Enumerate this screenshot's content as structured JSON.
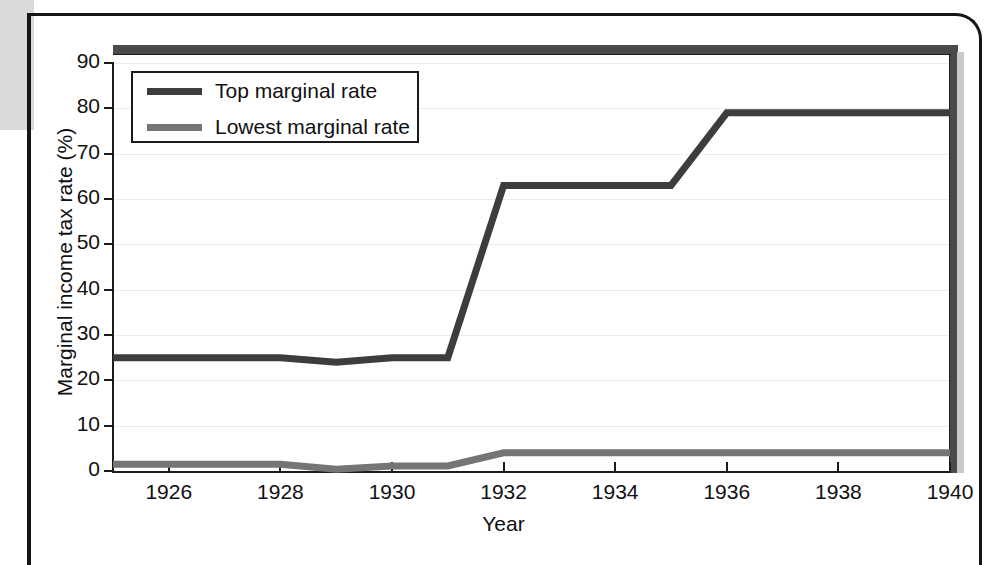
{
  "figure": {
    "x_axis_title": "Year",
    "y_axis_title": "Marginal income tax rate (%)"
  },
  "legend": {
    "items": [
      {
        "label": "Top marginal rate",
        "color": "#3d3d3f",
        "name": "top-marginal-rate"
      },
      {
        "label": "Lowest marginal rate",
        "color": "#757578",
        "name": "lowest-marginal-rate"
      }
    ]
  },
  "axes": {
    "y_ticks": [
      "0",
      "10",
      "20",
      "30",
      "40",
      "50",
      "60",
      "70",
      "80",
      "90"
    ],
    "x_ticks": [
      "1926",
      "1928",
      "1930",
      "1932",
      "1934",
      "1936",
      "1938",
      "1940"
    ]
  },
  "chart_data": {
    "type": "line",
    "title": "",
    "xlabel": "Year",
    "ylabel": "Marginal income tax rate (%)",
    "xlim": [
      1925,
      1940
    ],
    "ylim": [
      0,
      90
    ],
    "xticks": [
      1926,
      1928,
      1930,
      1932,
      1934,
      1936,
      1938,
      1940
    ],
    "yticks": [
      0,
      10,
      20,
      30,
      40,
      50,
      60,
      70,
      80,
      90
    ],
    "grid": "horizontal",
    "legend_position": "upper-left-inside",
    "x": [
      1925,
      1926,
      1927,
      1928,
      1929,
      1930,
      1931,
      1932,
      1933,
      1934,
      1935,
      1936,
      1937,
      1938,
      1939,
      1940
    ],
    "series": [
      {
        "name": "Top marginal rate",
        "color": "#3d3d3f",
        "values": [
          25,
          25,
          25,
          25,
          24,
          25,
          25,
          63,
          63,
          63,
          63,
          79,
          79,
          79,
          79,
          79
        ]
      },
      {
        "name": "Lowest marginal rate",
        "color": "#757578",
        "values": [
          1.5,
          1.5,
          1.5,
          1.5,
          0.375,
          1.125,
          1.125,
          4,
          4,
          4,
          4,
          4,
          4,
          4,
          4,
          4
        ]
      }
    ]
  }
}
